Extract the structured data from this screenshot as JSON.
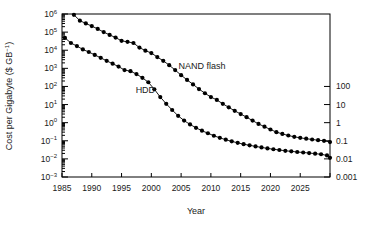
{
  "chart_data": {
    "type": "line",
    "title": "",
    "xlabel": "Year",
    "ylabel": "Cost per Gigabyte ($ GB⁻¹)",
    "ylabel_right": "",
    "xlim": [
      1985,
      2030
    ],
    "ylim": [
      0.001,
      1000000
    ],
    "yscale": "log",
    "xticks": [
      1985,
      1990,
      1995,
      2000,
      2005,
      2010,
      2015,
      2020,
      2025,
      2030
    ],
    "xticklabels": [
      "1985",
      "1990",
      "1995",
      "2000",
      "2005",
      "2010",
      "2015",
      "2020",
      "2025",
      ""
    ],
    "yticks": [
      0.001,
      0.01,
      0.1,
      1,
      10,
      100,
      1000,
      10000,
      100000,
      1000000
    ],
    "yticklabels": [
      "10⁻³",
      "10⁻²",
      "10⁻¹",
      "10⁰",
      "10¹",
      "10²",
      "10³",
      "10⁴",
      "10⁵",
      "10⁶"
    ],
    "yticks_right": [
      0.001,
      0.01,
      0.1,
      1,
      10,
      100
    ],
    "yticklabels_right": [
      "0.001",
      "0.01",
      "0.1",
      "1",
      "10",
      "100"
    ],
    "grid": false,
    "legend_position": "inline-annotation",
    "marker": "filled-circle",
    "marker_color": "#000000",
    "line_color": "#000000",
    "annotations": [
      {
        "text": "NAND flash",
        "x": 2008.5,
        "y": 900
      },
      {
        "text": "HDD",
        "x": 1999.0,
        "y": 42
      }
    ],
    "series": [
      {
        "name": "NAND flash",
        "points": [
          [
            1987.0,
            900000
          ],
          [
            1988.0,
            430000
          ],
          [
            1989.0,
            300000
          ],
          [
            1990.0,
            215000
          ],
          [
            1991.0,
            150000
          ],
          [
            1992.0,
            100000
          ],
          [
            1993.0,
            70000
          ],
          [
            1994.0,
            50000
          ],
          [
            1995.0,
            33000
          ],
          [
            1996.0,
            29000
          ],
          [
            1997.0,
            25000
          ],
          [
            1998.0,
            14000
          ],
          [
            1999.0,
            9500
          ],
          [
            2000.0,
            7000
          ],
          [
            2001.0,
            4200
          ],
          [
            2002.0,
            2600
          ],
          [
            2003.0,
            1500
          ],
          [
            2004.0,
            800
          ],
          [
            2005.0,
            420
          ],
          [
            2006.0,
            230
          ],
          [
            2007.0,
            130
          ],
          [
            2008.0,
            72
          ],
          [
            2009.0,
            42
          ],
          [
            2010.0,
            26
          ],
          [
            2011.0,
            18
          ],
          [
            2012.0,
            11
          ],
          [
            2013.0,
            7.0
          ],
          [
            2014.0,
            4.5
          ],
          [
            2015.0,
            3.0
          ],
          [
            2016.0,
            2.0
          ],
          [
            2017.0,
            1.3
          ],
          [
            2018.0,
            0.85
          ],
          [
            2019.0,
            0.6
          ],
          [
            2020.0,
            0.42
          ],
          [
            2021.0,
            0.3
          ],
          [
            2022.0,
            0.24
          ],
          [
            2023.0,
            0.195
          ],
          [
            2024.0,
            0.165
          ],
          [
            2025.0,
            0.145
          ],
          [
            2026.0,
            0.13
          ],
          [
            2027.0,
            0.118
          ],
          [
            2028.0,
            0.108
          ],
          [
            2029.0,
            0.1
          ],
          [
            2030.0,
            0.085
          ]
        ]
      },
      {
        "name": "HDD",
        "points": [
          [
            1985.5,
            48000
          ],
          [
            1986.5,
            25000
          ],
          [
            1987.5,
            17000
          ],
          [
            1988.5,
            11000
          ],
          [
            1989.5,
            8000
          ],
          [
            1990.5,
            5500
          ],
          [
            1991.5,
            3800
          ],
          [
            1992.5,
            2600
          ],
          [
            1993.5,
            1800
          ],
          [
            1994.5,
            1250
          ],
          [
            1995.5,
            800
          ],
          [
            1996.5,
            700
          ],
          [
            1997.5,
            480
          ],
          [
            1998.5,
            300
          ],
          [
            1999.5,
            170
          ],
          [
            2000.5,
            70
          ],
          [
            2001.5,
            26
          ],
          [
            2002.5,
            11
          ],
          [
            2003.5,
            5.0
          ],
          [
            2004.5,
            2.4
          ],
          [
            2005.5,
            1.3
          ],
          [
            2006.5,
            0.8
          ],
          [
            2007.5,
            0.52
          ],
          [
            2008.5,
            0.36
          ],
          [
            2009.5,
            0.26
          ],
          [
            2010.5,
            0.19
          ],
          [
            2011.5,
            0.145
          ],
          [
            2012.5,
            0.115
          ],
          [
            2013.5,
            0.093
          ],
          [
            2014.5,
            0.077
          ],
          [
            2015.5,
            0.065
          ],
          [
            2016.5,
            0.056
          ],
          [
            2017.5,
            0.049
          ],
          [
            2018.5,
            0.043
          ],
          [
            2019.5,
            0.038
          ],
          [
            2020.5,
            0.034
          ],
          [
            2021.5,
            0.031
          ],
          [
            2022.5,
            0.028
          ],
          [
            2023.5,
            0.026
          ],
          [
            2024.5,
            0.024
          ],
          [
            2025.5,
            0.0225
          ],
          [
            2026.5,
            0.021
          ],
          [
            2027.5,
            0.0195
          ],
          [
            2028.5,
            0.018
          ],
          [
            2029.5,
            0.0155
          ],
          [
            2030.0,
            0.0115
          ]
        ]
      }
    ]
  },
  "figure": {
    "background": "#ffffff",
    "axis_color": "#000000"
  }
}
